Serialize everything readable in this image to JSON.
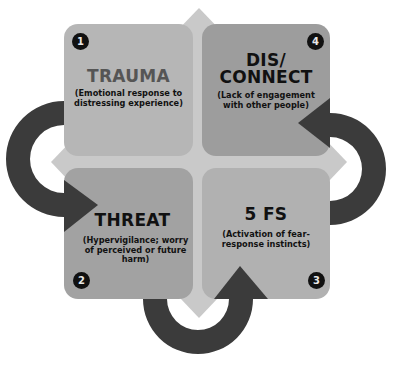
{
  "diagram": {
    "colors": {
      "background": "#ffffff",
      "diamond": "#c9c9c9",
      "arrow": "#3b3b3b",
      "box_trauma": "#b6b6b6",
      "box_disconnect": "#9d9d9d",
      "box_threat": "#a2a2a2",
      "box_5fs": "#b1b1b1",
      "badge": "#111111"
    },
    "steps": [
      {
        "number": "1",
        "title": "TRAUMA",
        "description": "(Emotional response to distressing experience)"
      },
      {
        "number": "2",
        "title": "THREAT",
        "description": "(Hypervigilance; worry of perceived or future harm)"
      },
      {
        "number": "3",
        "title": "5 FS",
        "description": "(Activation of fear-response instincts)"
      },
      {
        "number": "4",
        "title_line1": "DIS/",
        "title_line2": "CONNECT",
        "description": "(Lack of engagement with other people)"
      }
    ],
    "cycle_arrows": [
      {
        "from": "TRAUMA",
        "to": "THREAT",
        "icon": "curved-arrow-right"
      },
      {
        "from": "THREAT",
        "to": "5 FS",
        "icon": "curved-arrow-up"
      },
      {
        "from": "5 FS",
        "to": "DIS/CONNECT",
        "icon": "curved-arrow-left"
      }
    ]
  }
}
